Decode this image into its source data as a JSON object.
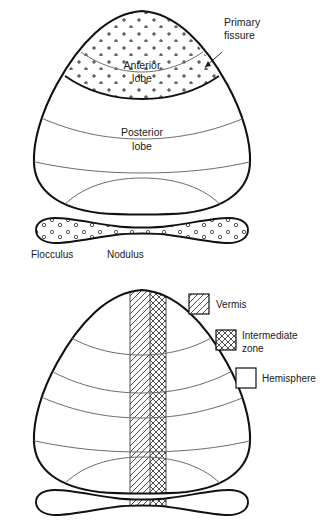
{
  "figure": {
    "colors": {
      "outline": "#111111",
      "fissure": "#6b6b6b",
      "hatch": "#3a3a3a",
      "text": "#1a1a1a",
      "background": "#ffffff"
    }
  },
  "panel_top": {
    "name": "Cerebellum lobes (dorsal view)",
    "labels": {
      "anterior_lobe": "Anterior",
      "anterior_lobe_line2": "lobe",
      "posterior_lobe": "Posterior",
      "posterior_lobe_line2": "lobe",
      "primary_fissure": "Primary",
      "primary_fissure_line2": "fissure",
      "flocculus": "Flocculus",
      "nodulus": "Nodulus"
    },
    "fill_patterns": {
      "anterior_lobe": "plus-stipple",
      "flocculonodular_lobe": "circle-stipple"
    }
  },
  "panel_bottom": {
    "name": "Cerebellum longitudinal zones (dorsal view)",
    "legend": {
      "items": [
        {
          "label": "Vermis",
          "pattern": "diagonal-hatch"
        },
        {
          "label": "Intermediate",
          "label_line2": "zone",
          "pattern": "cross-hatch"
        },
        {
          "label": "Hemisphere",
          "pattern": "blank"
        }
      ]
    }
  }
}
